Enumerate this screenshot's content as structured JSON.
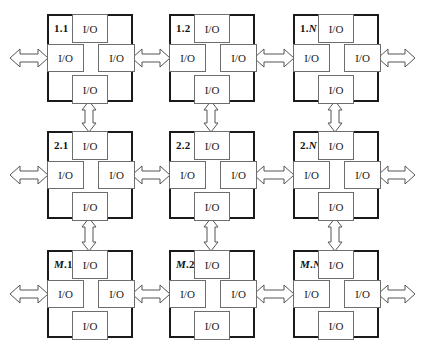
{
  "diagram": {
    "type": "mesh-grid",
    "rows_label": "M",
    "cols_label": "N",
    "port_label": "I/O",
    "nodes": [
      {
        "id": "1.1",
        "prefix": "1",
        "suffix": "1",
        "italic_prefix": false,
        "italic_suffix": false
      },
      {
        "id": "1.2",
        "prefix": "1",
        "suffix": "2",
        "italic_prefix": false,
        "italic_suffix": false
      },
      {
        "id": "1.N",
        "prefix": "1",
        "suffix": "N",
        "italic_prefix": false,
        "italic_suffix": true
      },
      {
        "id": "2.1",
        "prefix": "2",
        "suffix": "1",
        "italic_prefix": false,
        "italic_suffix": false
      },
      {
        "id": "2.2",
        "prefix": "2",
        "suffix": "2",
        "italic_prefix": false,
        "italic_suffix": false
      },
      {
        "id": "2.N",
        "prefix": "2",
        "suffix": "N",
        "italic_prefix": false,
        "italic_suffix": true
      },
      {
        "id": "M.1",
        "prefix": "M",
        "suffix": "1",
        "italic_prefix": true,
        "italic_suffix": false
      },
      {
        "id": "M.2",
        "prefix": "M",
        "suffix": "2",
        "italic_prefix": true,
        "italic_suffix": false
      },
      {
        "id": "M.N",
        "prefix": "M",
        "suffix": "N",
        "italic_prefix": true,
        "italic_suffix": true
      }
    ],
    "ports": [
      "top",
      "left",
      "right",
      "bottom"
    ],
    "connections": {
      "horizontal": "bidirectional arrows between adjacent nodes in each row, plus external arrows at left and right edges",
      "vertical": "bidirectional arrows between adjacent nodes in each column"
    },
    "colors": {
      "node_border": "#1a1a1a",
      "port_border": "#6d6d6d",
      "arrow_stroke": "#555555",
      "background": "#ffffff"
    }
  }
}
